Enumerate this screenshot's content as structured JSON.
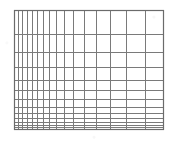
{
  "figure": {
    "kind": "log-log-graph-paper",
    "title": "",
    "background_color": "#ffffff",
    "line_color": "#7a7a7a",
    "border_color": "#6b6b6b"
  },
  "plot_area": {
    "left_px": 14,
    "top_px": 10,
    "right_px": 163,
    "bottom_px": 129,
    "width_px": 149,
    "height_px": 119,
    "border_width_px": 1.2,
    "grid_line_width_px": 1.0
  },
  "chart_data": {
    "type": "line",
    "title": "",
    "xlabel": "",
    "ylabel": "",
    "grid": true,
    "legend": "none",
    "series": [],
    "x": [],
    "x_scale": "log",
    "y_scale": "log",
    "xlim": [
      1,
      20
    ],
    "ylim": [
      1,
      20
    ],
    "x_tick_labels": [],
    "y_tick_labels": [],
    "x_gridlines_px": [
      14,
      18,
      22,
      27,
      32,
      37,
      43,
      49,
      56,
      64,
      73,
      84,
      96,
      110,
      126,
      145,
      163
    ],
    "y_gridlines_px": [
      10,
      34,
      52,
      67,
      80,
      90,
      99,
      107,
      113,
      118,
      122,
      125,
      127,
      129
    ]
  }
}
